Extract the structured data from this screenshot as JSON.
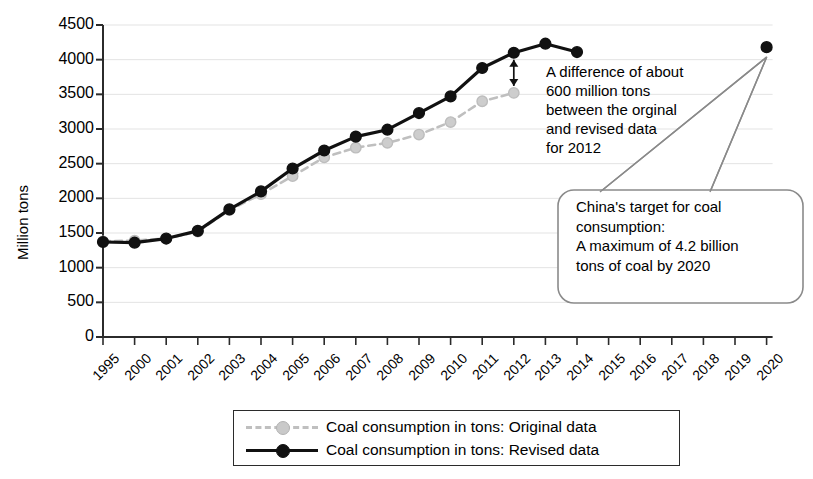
{
  "chart_data": {
    "type": "line",
    "title": "",
    "xlabel": "",
    "ylabel": "Million tons",
    "ylim": [
      0,
      4500
    ],
    "ytick_step": 500,
    "grid": true,
    "legend_position": "bottom",
    "categories": [
      "1995",
      "2000",
      "2001",
      "2002",
      "2003",
      "2004",
      "2005",
      "2006",
      "2007",
      "2008",
      "2009",
      "2010",
      "2011",
      "2012",
      "2013",
      "2014",
      "2015",
      "2016",
      "2017",
      "2018",
      "2019",
      "2020"
    ],
    "yticks": [
      "0",
      "500",
      "1000",
      "1500",
      "2000",
      "2500",
      "3000",
      "3500",
      "4000",
      "4500"
    ],
    "series": [
      {
        "name": "Coal consumption in tons: Original data",
        "style": "dashed",
        "color": "#bfbfbf",
        "marker": "circle",
        "x": [
          "1995",
          "2000",
          "2001",
          "2002",
          "2003",
          "2004",
          "2005",
          "2006",
          "2007",
          "2008",
          "2009",
          "2010",
          "2011",
          "2012"
        ],
        "values": [
          1380,
          1390,
          1420,
          1520,
          1830,
          2060,
          2320,
          2590,
          2730,
          2800,
          2920,
          3100,
          3400,
          3520
        ]
      },
      {
        "name": "Coal consumption in tons: Revised data",
        "style": "solid",
        "color": "#111111",
        "marker": "circle",
        "x": [
          "1995",
          "2000",
          "2001",
          "2002",
          "2003",
          "2004",
          "2005",
          "2006",
          "2007",
          "2008",
          "2009",
          "2010",
          "2011",
          "2012",
          "2013",
          "2014"
        ],
        "values": [
          1370,
          1360,
          1420,
          1530,
          1840,
          2100,
          2430,
          2690,
          2890,
          2990,
          3230,
          3470,
          3880,
          4100,
          4230,
          4110
        ]
      },
      {
        "name": "China's target for coal consumption 2020",
        "style": "point-only",
        "color": "#111111",
        "marker": "circle",
        "x": [
          "2020"
        ],
        "values": [
          4180
        ]
      }
    ],
    "annotations": [
      {
        "name": "difference-annotation",
        "text": "A difference of about\n600 million tons\nbetween the orginal\nand revised data\nfor 2012",
        "arrow": "double-headed vertical arrow between revised and original 2012 values"
      },
      {
        "name": "target-callout",
        "text": "China's target for coal\nconsumption:\nA maximum of 4.2 billion\ntons of coal by 2020",
        "points_to": "2020"
      }
    ]
  },
  "legend": {
    "items": [
      {
        "label": "Coal consumption in tons: Original data",
        "color": "#bfbfbf",
        "style": "dashed"
      },
      {
        "label": "Coal consumption in tons: Revised data",
        "color": "#111111",
        "style": "solid"
      }
    ]
  },
  "axis": {
    "y_title": "Million tons"
  },
  "colors": {
    "original": "#bfbfbf",
    "revised": "#111111",
    "grid": "#e3e3e3",
    "axis": "#2b2b2b",
    "callout_border": "#8a8a8a"
  }
}
